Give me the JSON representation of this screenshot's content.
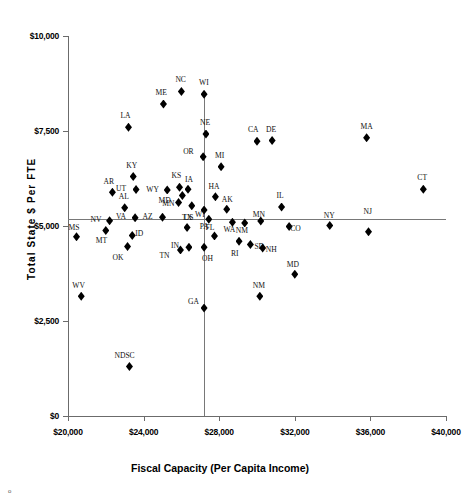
{
  "chart_data": {
    "type": "scatter",
    "title": "",
    "xlabel": "Fiscal Capacity (Per Capita Income)",
    "ylabel": "Total State $ Per FTE",
    "xlim": [
      20000,
      40000
    ],
    "ylim": [
      0,
      10000
    ],
    "xticks": [
      "$20,000",
      "$24,000",
      "$28,000",
      "$32,000",
      "$36,000",
      "$40,000"
    ],
    "xtick_values": [
      20000,
      24000,
      28000,
      32000,
      36000,
      40000
    ],
    "yticks": [
      "$0",
      "$2,500",
      "$5,000",
      "$7,500",
      "$10,000"
    ],
    "ytick_values": [
      0,
      2500,
      5000,
      7500,
      10000
    ],
    "grid": false,
    "legend": null,
    "reference_lines": {
      "vertical_x": 27200,
      "horizontal_y": 5180
    },
    "points": [
      {
        "label": "NC",
        "x": 26000,
        "y": 8540,
        "lx": 0,
        "ly": -13
      },
      {
        "label": "WI",
        "x": 27200,
        "y": 8470,
        "lx": 1,
        "ly": -13
      },
      {
        "label": "ME",
        "x": 25050,
        "y": 8210,
        "lx": -2,
        "ly": -13
      },
      {
        "label": "LA",
        "x": 23200,
        "y": 7600,
        "lx": -2,
        "ly": -13
      },
      {
        "label": "MA",
        "x": 35800,
        "y": 7320,
        "lx": 0,
        "ly": -13
      },
      {
        "label": "NE",
        "x": 27300,
        "y": 7420,
        "lx": 0,
        "ly": -13
      },
      {
        "label": "CA",
        "x": 30000,
        "y": 7230,
        "lx": -3,
        "ly": -13
      },
      {
        "label": "DE",
        "x": 30800,
        "y": 7250,
        "lx": 0,
        "ly": -13
      },
      {
        "label": "OR",
        "x": 27150,
        "y": 6820,
        "lx": -14,
        "ly": -7
      },
      {
        "label": "MI",
        "x": 28100,
        "y": 6560,
        "lx": 0,
        "ly": -13
      },
      {
        "label": "KY",
        "x": 23450,
        "y": 6300,
        "lx": -1,
        "ly": -13
      },
      {
        "label": "KS",
        "x": 25900,
        "y": 6020,
        "lx": -2,
        "ly": -13
      },
      {
        "label": "CT",
        "x": 38800,
        "y": 5970,
        "lx": 0,
        "ly": -13
      },
      {
        "label": "IA",
        "x": 26350,
        "y": 5970,
        "lx": 3,
        "ly": -11
      },
      {
        "label": "UT",
        "x": 23600,
        "y": 5960,
        "lx": -14,
        "ly": -3
      },
      {
        "label": "AR",
        "x": 22350,
        "y": 5890,
        "lx": -3,
        "ly": -12
      },
      {
        "label": "WY",
        "x": 25250,
        "y": 5950,
        "lx": -15,
        "ly": -2
      },
      {
        "label": "HA",
        "x": 27800,
        "y": 5770,
        "lx": -1,
        "ly": -12
      },
      {
        "label": "IL",
        "x": 31300,
        "y": 5500,
        "lx": 1,
        "ly": -13
      },
      {
        "label": "MN",
        "x": 26050,
        "y": 5800,
        "lx": -14,
        "ly": 6
      },
      {
        "label": "MD2",
        "x": 25850,
        "y": 5620,
        "lx": -14,
        "ly": -3
      },
      {
        "label": "US",
        "x": 26550,
        "y": 5530,
        "lx": -2,
        "ly": 10
      },
      {
        "label": "AL",
        "x": 23000,
        "y": 5480,
        "lx": 0,
        "ly": -13
      },
      {
        "label": "AK",
        "x": 28400,
        "y": 5440,
        "lx": 1,
        "ly": -11
      },
      {
        "label": "WI2",
        "x": 27200,
        "y": 5420,
        "lx": -3,
        "ly": 3
      },
      {
        "label": "AZ",
        "x": 25000,
        "y": 5230,
        "lx": -14,
        "ly": -2
      },
      {
        "label": "NV",
        "x": 22200,
        "y": 5140,
        "lx": -13,
        "ly": -3
      },
      {
        "label": "VA",
        "x": 23550,
        "y": 5220,
        "lx": -13,
        "ly": -3
      },
      {
        "label": "PA",
        "x": 27450,
        "y": 5180,
        "lx": -3,
        "ly": 6
      },
      {
        "label": "WA",
        "x": 28700,
        "y": 5100,
        "lx": -3,
        "ly": 6
      },
      {
        "label": "NM",
        "x": 29350,
        "y": 5080,
        "lx": -3,
        "ly": 6
      },
      {
        "label": "MN2",
        "x": 30200,
        "y": 5130,
        "lx": -2,
        "ly": -8
      },
      {
        "label": "NY",
        "x": 33850,
        "y": 5010,
        "lx": 0,
        "ly": -12
      },
      {
        "label": "NJ",
        "x": 35900,
        "y": 4850,
        "lx": 1,
        "ly": -22
      },
      {
        "label": "CO",
        "x": 31700,
        "y": 4990,
        "lx": 7,
        "ly": 1
      },
      {
        "label": "MS",
        "x": 20450,
        "y": 4720,
        "lx": -2,
        "ly": -11
      },
      {
        "label": "MT",
        "x": 22000,
        "y": 4880,
        "lx": -4,
        "ly": 8
      },
      {
        "label": "ID",
        "x": 23400,
        "y": 4750,
        "lx": 9,
        "ly": -4
      },
      {
        "label": "OK",
        "x": 23150,
        "y": 4460,
        "lx": -9,
        "ly": 9
      },
      {
        "label": "FL",
        "x": 27750,
        "y": 4740,
        "lx": -3,
        "ly": -10
      },
      {
        "label": "TX",
        "x": 26300,
        "y": 4960,
        "lx": 1,
        "ly": -12
      },
      {
        "label": "IN",
        "x": 26400,
        "y": 4440,
        "lx": -12,
        "ly": -3
      },
      {
        "label": "TN",
        "x": 25950,
        "y": 4370,
        "lx": -15,
        "ly": 4
      },
      {
        "label": "RI",
        "x": 29050,
        "y": 4600,
        "lx": -2,
        "ly": 11
      },
      {
        "label": "OH",
        "x": 27200,
        "y": 4440,
        "lx": 4,
        "ly": 10
      },
      {
        "label": "SD",
        "x": 29650,
        "y": 4510,
        "lx": 10,
        "ly": 0
      },
      {
        "label": "NH",
        "x": 30300,
        "y": 4420,
        "lx": 9,
        "ly": 0
      },
      {
        "label": "MD",
        "x": 32000,
        "y": 3730,
        "lx": -2,
        "ly": -11
      },
      {
        "label": "NM2",
        "x": 30150,
        "y": 3150,
        "lx": -1,
        "ly": -12
      },
      {
        "label": "WV",
        "x": 20700,
        "y": 3150,
        "lx": -3,
        "ly": -12
      },
      {
        "label": "GA",
        "x": 27200,
        "y": 2840,
        "lx": -10,
        "ly": -8
      },
      {
        "label": "NDSC",
        "x": 23250,
        "y": 1300,
        "lx": -9,
        "ly": -13
      }
    ]
  },
  "corner_mark": "o"
}
